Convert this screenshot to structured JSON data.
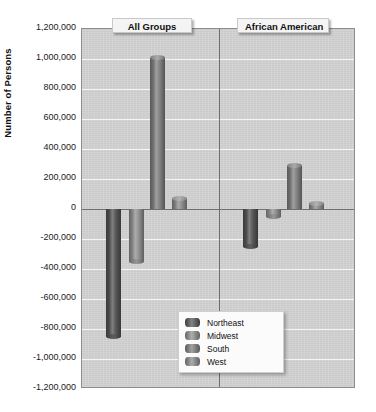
{
  "chart_data": {
    "type": "bar",
    "title": "",
    "xlabel": "",
    "ylabel": "Number of Persons",
    "ylim": [
      -1200000,
      1200000
    ],
    "ytick_step": 200000,
    "grid": true,
    "legend_position": "inside-bottom-center",
    "panels": [
      {
        "name": "All Groups",
        "categories": [
          "Northeast",
          "Midwest",
          "South",
          "West"
        ],
        "values": [
          -850000,
          -350000,
          1010000,
          70000
        ]
      },
      {
        "name": "African American",
        "categories": [
          "Northeast",
          "Midwest",
          "South",
          "West"
        ],
        "values": [
          -250000,
          -50000,
          290000,
          40000
        ]
      }
    ],
    "y_tick_labels": [
      "1,200,000",
      "1,000,000",
      "800,000",
      "600,000",
      "400,000",
      "200,000",
      "0",
      "-200,000",
      "-400,000",
      "-600,000",
      "-800,000",
      "-1,000,000",
      "-1,200,000"
    ],
    "y_tick_values": [
      1200000,
      1000000,
      800000,
      600000,
      400000,
      200000,
      0,
      -200000,
      -400000,
      -600000,
      -800000,
      -1000000,
      -1200000
    ],
    "series_colors": {
      "Northeast": "#545454",
      "Midwest": "#8f8f8f",
      "South": "#7e7e7e",
      "West": "#8b8b8b"
    },
    "plot_background": "#d2d2d2",
    "gridline_color": "#f4f4f4",
    "axis_color": "#6e6e6e"
  },
  "legend": {
    "items": [
      {
        "label": "Northeast",
        "color": "#545454"
      },
      {
        "label": "Midwest",
        "color": "#8f8f8f"
      },
      {
        "label": "South",
        "color": "#7e7e7e"
      },
      {
        "label": "West",
        "color": "#8b8b8b"
      }
    ]
  }
}
